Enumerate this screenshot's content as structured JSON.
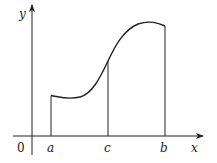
{
  "diagram": {
    "type": "function-graph",
    "axes": {
      "x_label": "x",
      "y_label": "y",
      "origin_label": "0"
    },
    "points": [
      {
        "name": "a",
        "label": "a"
      },
      {
        "name": "c",
        "label": "c"
      },
      {
        "name": "b",
        "label": "b"
      }
    ],
    "colors": {
      "stroke": "#222222",
      "background": "#ffffff"
    }
  }
}
